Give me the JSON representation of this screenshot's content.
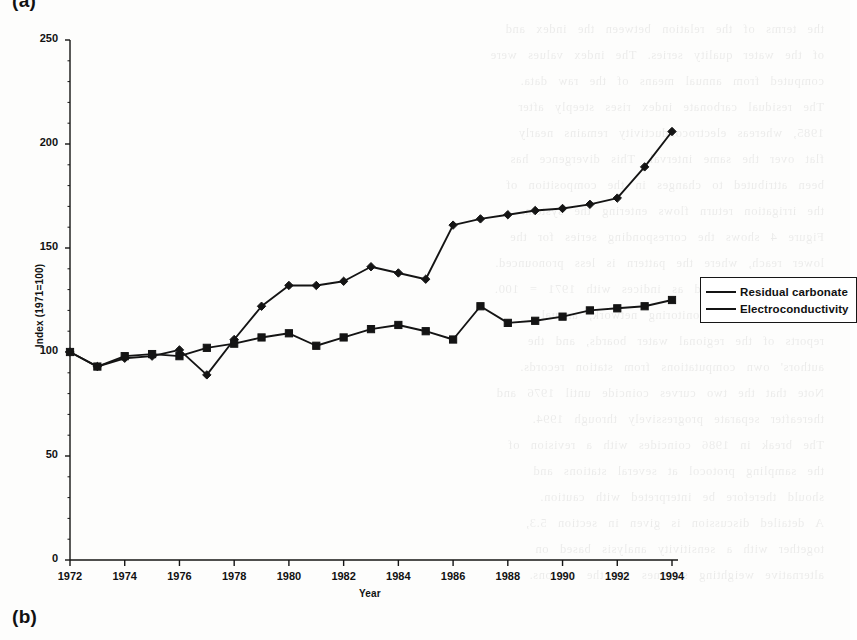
{
  "figure": {
    "panel_label_a": "(a)",
    "panel_label_b": "(b)"
  },
  "legend": {
    "position": "right",
    "entries": [
      {
        "label": "Residual carbonate",
        "marker": "diamond-marker"
      },
      {
        "label": "Electroconductivity",
        "marker": "square-marker"
      }
    ]
  },
  "axes": {
    "xlabel": "Year",
    "ylabel": "Index (1971=100)",
    "ytick_labels": [
      "0",
      "50",
      "100",
      "150",
      "200",
      "250"
    ],
    "xtick_labels": [
      "1972",
      "1974",
      "1976",
      "1978",
      "1980",
      "1982",
      "1984",
      "1986",
      "1988",
      "1990",
      "1992",
      "1994"
    ]
  },
  "colors": {
    "ink": "#141414",
    "paper": "#fdfdfc"
  },
  "chart_data": {
    "type": "line",
    "title": "",
    "xlabel": "Year",
    "ylabel": "Index (1971=100)",
    "xlim": [
      1972,
      1994
    ],
    "ylim": [
      0,
      250
    ],
    "ytick_values": [
      0,
      50,
      100,
      150,
      200,
      250
    ],
    "xtick_values": [
      1972,
      1974,
      1976,
      1978,
      1980,
      1982,
      1984,
      1986,
      1988,
      1990,
      1992,
      1994
    ],
    "grid": false,
    "legend_position": "right",
    "x": [
      1972,
      1973,
      1974,
      1975,
      1976,
      1977,
      1978,
      1979,
      1980,
      1981,
      1982,
      1983,
      1984,
      1985,
      1986,
      1987,
      1988,
      1989,
      1990,
      1991,
      1992,
      1993,
      1994
    ],
    "series": [
      {
        "name": "Residual carbonate",
        "marker": "diamond",
        "values": [
          100,
          93,
          97,
          98,
          101,
          89,
          106,
          122,
          132,
          132,
          134,
          141,
          138,
          135,
          161,
          164,
          166,
          168,
          169,
          171,
          174,
          189,
          206
        ]
      },
      {
        "name": "Electroconductivity",
        "marker": "square",
        "values": [
          100,
          93,
          98,
          99,
          98,
          102,
          104,
          107,
          109,
          103,
          107,
          111,
          113,
          110,
          106,
          122,
          114,
          115,
          117,
          120,
          121,
          122,
          125
        ]
      }
    ]
  },
  "ghost_text": [
    "the terms of the relation between the index and",
    "of the water quality series. The index values were",
    "computed from annual means of the raw data.",
    "The residual carbonate index rises steeply after",
    "1985, whereas electroconductivity remains nearly",
    "flat over the same interval. This divergence has",
    "been attributed to changes in the composition of",
    "the irrigation return flows entering the system.",
    "Figure 4 shows the corresponding series for the",
    "lower reach, where the pattern is less pronounced.",
    "Values are expressed as indices with 1971 = 100.",
    "Sources: national monitoring network, annual",
    "reports of the regional water boards, and the",
    "authors' own computations from station records.",
    "Note that the two curves coincide until 1976 and",
    "thereafter separate progressively through 1994.",
    "The break in 1986 coincides with a revision of",
    "the sampling protocol at several stations and",
    "should therefore be interpreted with caution.",
    "A detailed discussion is given in section 5.3,",
    "together with a sensitivity analysis based on",
    "alternative weighting schemes for the stations."
  ]
}
